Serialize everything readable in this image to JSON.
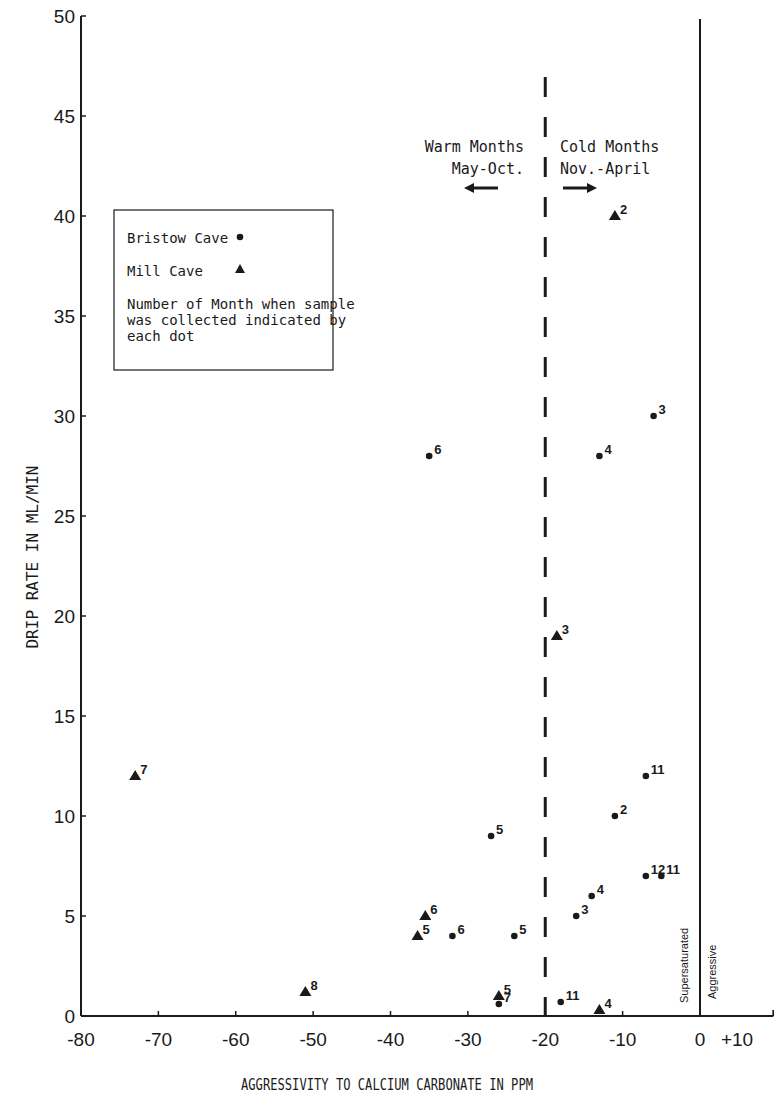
{
  "chart_data": {
    "type": "scatter",
    "title": "",
    "xlabel": "AGGRESSIVITY TO CALCIUM CARBONATE IN PPM",
    "ylabel": "DRIP RATE IN ML/MIN",
    "xlim": [
      -80,
      10
    ],
    "ylim": [
      0,
      50
    ],
    "x_ticks": [
      -80,
      -70,
      -60,
      -50,
      -40,
      -30,
      -20,
      -10,
      0,
      10
    ],
    "x_tick_labels": [
      "-80",
      "-70",
      "-60",
      "-50",
      "-40",
      "-30",
      "-20",
      "-10",
      "0",
      "+10"
    ],
    "y_ticks": [
      0,
      5,
      10,
      15,
      20,
      25,
      30,
      35,
      40,
      45,
      50
    ],
    "y_tick_labels": [
      "0",
      "5",
      "10",
      "15",
      "20",
      "25",
      "30",
      "35",
      "40",
      "45",
      "50"
    ],
    "grid": false,
    "legend_position": "upper-left (boxed)",
    "series": [
      {
        "name": "Bristow Cave",
        "marker": "circle",
        "points": [
          {
            "x": -35,
            "y": 28,
            "month": "6"
          },
          {
            "x": -6,
            "y": 30,
            "month": "3"
          },
          {
            "x": -13,
            "y": 28,
            "month": "4"
          },
          {
            "x": -7,
            "y": 12,
            "month": "11"
          },
          {
            "x": -11,
            "y": 10,
            "month": "2"
          },
          {
            "x": -27,
            "y": 9,
            "month": "5"
          },
          {
            "x": -7,
            "y": 7,
            "month": "12"
          },
          {
            "x": -5,
            "y": 7,
            "month": "11"
          },
          {
            "x": -14,
            "y": 6,
            "month": "4"
          },
          {
            "x": -16,
            "y": 5,
            "month": "3"
          },
          {
            "x": -32,
            "y": 4,
            "month": "6"
          },
          {
            "x": -24,
            "y": 4,
            "month": "5"
          },
          {
            "x": -18,
            "y": 0.7,
            "month": "11"
          },
          {
            "x": -26,
            "y": 0.6,
            "month": "7"
          }
        ]
      },
      {
        "name": "Mill Cave",
        "marker": "triangle",
        "points": [
          {
            "x": -11,
            "y": 40,
            "month": "2"
          },
          {
            "x": -18.5,
            "y": 19,
            "month": "3"
          },
          {
            "x": -73,
            "y": 12,
            "month": "7"
          },
          {
            "x": -35.5,
            "y": 5,
            "month": "6"
          },
          {
            "x": -36.5,
            "y": 4,
            "month": "5"
          },
          {
            "x": -51,
            "y": 1.2,
            "month": "8"
          },
          {
            "x": -26,
            "y": 1,
            "month": "5"
          },
          {
            "x": -13,
            "y": 0.3,
            "month": "4"
          }
        ]
      }
    ],
    "reference_lines": [
      {
        "x": -20,
        "style": "dashed",
        "meaning": "divides warm and cold months"
      },
      {
        "x": 0,
        "style": "solid",
        "meaning": "saturation boundary"
      }
    ],
    "annotations": {
      "warm": [
        "Warm Months",
        "May-Oct."
      ],
      "cold": [
        "Cold Months",
        "Nov.-April"
      ],
      "supersaturated": "Supersaturated",
      "aggressive": "Aggressive"
    },
    "legend": {
      "entries": [
        {
          "label": "Bristow Cave",
          "marker": "circle"
        },
        {
          "label": "Mill Cave",
          "marker": "triangle"
        }
      ],
      "note_lines": [
        "Number of Month when sample",
        "was collected indicated by",
        "each dot"
      ]
    }
  }
}
